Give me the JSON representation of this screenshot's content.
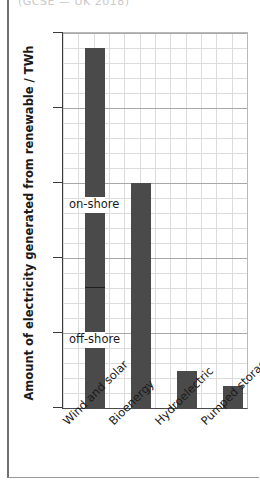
{
  "page": {
    "clipped_caption": "(GCSE — UK 2018)"
  },
  "chart_data": {
    "type": "bar",
    "title": "",
    "xlabel": "",
    "ylabel": "Amount of electricity generated from renewable / TWh",
    "categories": [
      "Wind and solar",
      "Bioenergy",
      "Hydroelectric",
      "Pumped storage"
    ],
    "values": [
      48,
      30,
      5,
      3
    ],
    "ylim": [
      0,
      50
    ],
    "yticks": [
      0,
      10,
      20,
      30,
      40,
      50
    ],
    "ytick_labels": [
      "0",
      "10",
      "20",
      "30",
      "40",
      "50"
    ],
    "grid": true,
    "grid_major_step": 10,
    "grid_minor_step": 2,
    "legend": "none",
    "bar_color": "#4a4a4a",
    "gridline_color": "#dcdcdc",
    "axis_color": "#3a3a3a",
    "annotations": [
      {
        "label": "on-shore",
        "series_index": 0,
        "value_range": [
          16,
          48
        ],
        "note": "upper segment of Wind and solar bar"
      },
      {
        "label": "off-shore",
        "series_index": 0,
        "value_range": [
          0,
          16
        ],
        "note": "lower segment of Wind and solar bar"
      }
    ],
    "segment_divider_value": 16
  },
  "axis": {
    "y_tick_0": "0",
    "y_tick_10": "10",
    "y_tick_20": "20",
    "y_tick_30": "30",
    "y_tick_40": "40",
    "y_tick_50": "50"
  },
  "labels": {
    "cat0": "Wind and solar",
    "cat1": "Bioenergy",
    "cat2": "Hydroelectric",
    "cat3": "Pumped storage",
    "onshore": "on-shore",
    "offshore": "off-shore"
  }
}
